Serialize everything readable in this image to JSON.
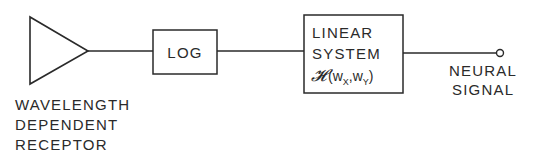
{
  "diagram": {
    "type": "block-diagram",
    "stroke_color": "#2a2a2a",
    "background": "#ffffff",
    "receptor": {
      "shape": "triangle",
      "label_lines": [
        "WAVELENGTH",
        "DEPENDENT",
        "RECEPTOR"
      ]
    },
    "log_block": {
      "label": "LOG"
    },
    "linear_block": {
      "label_lines": [
        "LINEAR",
        "SYSTEM"
      ],
      "transfer_function": {
        "symbol": "𝓗",
        "open": "(w",
        "sub_x": "X",
        "comma": ",w",
        "sub_y": "Y",
        "close": ")"
      }
    },
    "output": {
      "terminal": "open-circle",
      "label_lines": [
        "NEURAL",
        "SIGNAL"
      ]
    },
    "connections": [
      {
        "from": "receptor",
        "to": "log_block"
      },
      {
        "from": "log_block",
        "to": "linear_block"
      },
      {
        "from": "linear_block",
        "to": "output"
      }
    ]
  }
}
